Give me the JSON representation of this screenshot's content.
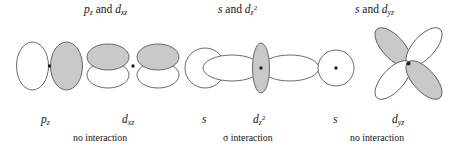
{
  "figure": {
    "title_hidden": "",
    "background": "#ffffff",
    "stroke_color": "#5a5a5a",
    "shaded_lobe_color": "#c9c9c9",
    "unshaded_lobe_color": "#ffffff",
    "nucleus_color": "#1e1e1e"
  },
  "groups": [
    {
      "id": "group-pz-dxz",
      "heading": {
        "left_orbital": "p",
        "left_subscript": "z",
        "conjunction": "and",
        "right_orbital": "d",
        "right_subscript": "xz",
        "full_text": "pz and dxz"
      },
      "left_orbital": {
        "name": "p-z-orbital",
        "label_symbol": "p",
        "label_subscript": "z",
        "label_superscript": "",
        "lobes": 2,
        "shading": [
          "unshaded",
          "shaded"
        ],
        "orientation": "vertical-pair"
      },
      "right_orbital": {
        "name": "d-xz-orbital",
        "label_symbol": "d",
        "label_subscript": "xz",
        "label_superscript": "",
        "lobes": 4,
        "shading": [
          "shaded",
          "shaded",
          "unshaded",
          "unshaded"
        ],
        "orientation": "horizontal-cloverleaf"
      },
      "interaction_note": "no interaction"
    },
    {
      "id": "group-s-dz2",
      "heading": {
        "left_orbital": "s",
        "left_subscript": "",
        "conjunction": "and",
        "right_orbital": "d",
        "right_subscript": "z",
        "right_superscript": "2",
        "full_text": "s and dz2"
      },
      "left_orbital": {
        "name": "s-orbital",
        "label_symbol": "s",
        "label_subscript": "",
        "label_superscript": "",
        "lobes": 1,
        "shading": [
          "unshaded"
        ],
        "orientation": "sphere"
      },
      "right_orbital": {
        "name": "d-z2-orbital",
        "label_symbol": "d",
        "label_subscript": "z",
        "label_superscript": "2",
        "lobes": 2,
        "shading": [
          "unshaded",
          "unshaded"
        ],
        "collar": "shaded",
        "orientation": "horizontal-pair-with-collar"
      },
      "interaction_note_symbol": "σ",
      "interaction_note": "interaction"
    },
    {
      "id": "group-s-dyz",
      "heading": {
        "left_orbital": "s",
        "left_subscript": "",
        "conjunction": "and",
        "right_orbital": "d",
        "right_subscript": "yz",
        "full_text": "s and dyz"
      },
      "left_orbital": {
        "name": "s-orbital",
        "label_symbol": "s",
        "label_subscript": "",
        "label_superscript": "",
        "lobes": 1,
        "shading": [
          "unshaded"
        ],
        "orientation": "sphere"
      },
      "right_orbital": {
        "name": "d-yz-orbital",
        "label_symbol": "d",
        "label_subscript": "yz",
        "label_superscript": "",
        "lobes": 4,
        "shading": [
          "shaded",
          "unshaded",
          "unshaded",
          "shaded"
        ],
        "orientation": "diagonal-cloverleaf"
      },
      "interaction_note": "no interaction"
    }
  ],
  "text": {
    "and": "and",
    "no_interaction": "no interaction",
    "sigma": "σ",
    "interaction": "interaction",
    "p": "p",
    "d": "d",
    "s": "s",
    "sub_z": "z",
    "sub_xz": "xz",
    "sub_yz": "yz",
    "sup_2": "2"
  }
}
